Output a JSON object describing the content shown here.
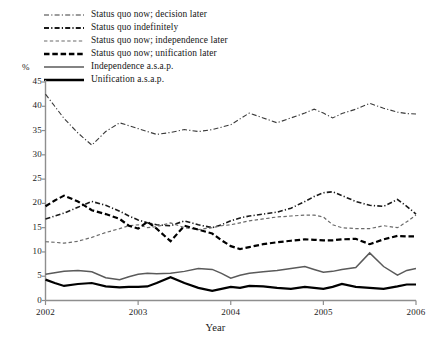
{
  "chart_data": {
    "type": "line",
    "title": "",
    "xlabel": "Year",
    "ylabel": "%",
    "ylim": [
      0,
      45
    ],
    "yticks": [
      0,
      5,
      10,
      15,
      20,
      25,
      30,
      35,
      40,
      45
    ],
    "ytick_labels": [
      "0",
      "5",
      "10",
      "15",
      "20",
      "25",
      "30",
      "35",
      "40",
      "45"
    ],
    "xlim": [
      2002,
      2006
    ],
    "xticks": [
      2002,
      2003,
      2004,
      2005,
      2006
    ],
    "xtick_labels": [
      "2002",
      "2003",
      "2004",
      "2005",
      "2006"
    ],
    "grid": false,
    "legend_position": "top-left",
    "x": [
      2002.0,
      2002.1,
      2002.2,
      2002.35,
      2002.5,
      2002.65,
      2002.8,
      2002.9,
      2003.0,
      2003.1,
      2003.2,
      2003.35,
      2003.5,
      2003.65,
      2003.8,
      2003.9,
      2004.0,
      2004.1,
      2004.2,
      2004.35,
      2004.5,
      2004.65,
      2004.8,
      2004.9,
      2005.0,
      2005.1,
      2005.2,
      2005.35,
      2005.5,
      2005.65,
      2005.8,
      2005.9,
      2006.0
    ],
    "series": [
      {
        "name": "Status quo now; decision later",
        "style": "dash-dot",
        "color": "#3a3a3a",
        "width": 1.1,
        "values": [
          42.5,
          40.0,
          37.5,
          34.5,
          32.0,
          34.8,
          36.6,
          36.0,
          35.4,
          34.8,
          34.2,
          34.6,
          35.2,
          34.8,
          35.2,
          35.7,
          36.2,
          37.4,
          38.6,
          37.6,
          36.6,
          37.6,
          38.6,
          39.4,
          38.6,
          37.6,
          38.5,
          39.4,
          40.6,
          39.6,
          38.8,
          38.5,
          38.4
        ]
      },
      {
        "name": "Status quo indefinitely",
        "style": "dash-dot",
        "color": "#1a1a1a",
        "width": 1.6,
        "values": [
          16.8,
          17.4,
          18.0,
          19.2,
          20.4,
          19.6,
          18.4,
          17.4,
          16.6,
          16.0,
          15.6,
          15.4,
          16.4,
          15.6,
          15.0,
          15.6,
          16.4,
          17.0,
          17.4,
          17.8,
          18.2,
          19.0,
          20.4,
          21.4,
          22.2,
          22.4,
          21.6,
          20.4,
          19.6,
          19.4,
          20.8,
          19.4,
          17.8
        ]
      },
      {
        "name": "Status quo now; independence later",
        "style": "fine-dash",
        "color": "#6a6a6a",
        "width": 1.2,
        "values": [
          12.1,
          12.0,
          11.8,
          12.2,
          13.0,
          14.0,
          14.8,
          15.4,
          15.6,
          15.0,
          15.2,
          16.0,
          15.0,
          14.6,
          15.0,
          15.4,
          15.6,
          16.0,
          16.4,
          16.8,
          17.2,
          17.4,
          17.6,
          17.6,
          17.2,
          15.6,
          15.0,
          14.8,
          14.8,
          15.4,
          15.0,
          16.2,
          17.6
        ]
      },
      {
        "name": "Status quo now; unification later",
        "style": "bold-dash",
        "color": "#000000",
        "width": 2.2,
        "values": [
          19.4,
          20.6,
          21.6,
          20.4,
          18.6,
          17.8,
          16.8,
          15.4,
          14.8,
          16.2,
          14.8,
          12.2,
          15.4,
          14.6,
          13.8,
          12.4,
          11.2,
          10.6,
          11.0,
          11.6,
          12.0,
          12.3,
          12.6,
          12.5,
          12.4,
          12.4,
          12.6,
          12.7,
          11.6,
          12.6,
          13.3,
          13.2,
          13.2
        ]
      },
      {
        "name": "Independence a.s.a.p.",
        "style": "solid",
        "color": "#5a5a5a",
        "width": 1.5,
        "values": [
          5.4,
          5.7,
          6.0,
          6.2,
          5.9,
          4.7,
          4.3,
          4.9,
          5.4,
          5.6,
          5.5,
          5.6,
          6.0,
          6.6,
          6.4,
          5.6,
          4.6,
          5.2,
          5.6,
          5.9,
          6.2,
          6.6,
          7.0,
          6.4,
          5.8,
          6.0,
          6.4,
          6.8,
          9.8,
          7.0,
          5.2,
          6.2,
          6.6
        ]
      },
      {
        "name": "Unification a.s.a.p.",
        "style": "solid",
        "color": "#000000",
        "width": 2.2,
        "values": [
          4.3,
          3.6,
          3.0,
          3.4,
          3.6,
          2.9,
          2.7,
          2.8,
          2.8,
          2.9,
          3.6,
          4.8,
          3.6,
          2.6,
          2.0,
          2.4,
          2.8,
          2.6,
          3.0,
          2.9,
          2.6,
          2.4,
          2.8,
          2.6,
          2.4,
          2.8,
          3.4,
          2.8,
          2.6,
          2.4,
          2.9,
          3.3,
          3.3
        ]
      }
    ]
  },
  "legend": {
    "items": [
      {
        "label": "Status quo now; decision later",
        "style": "dash-dot",
        "color": "#3a3a3a",
        "width": 1.1
      },
      {
        "label": "Status quo indefinitely",
        "style": "dash-dot",
        "color": "#1a1a1a",
        "width": 1.8
      },
      {
        "label": "Status quo now; independence later",
        "style": "fine-dash",
        "color": "#6a6a6a",
        "width": 1.2
      },
      {
        "label": "Status quo now; unification later",
        "style": "bold-dash",
        "color": "#000000",
        "width": 2.4
      },
      {
        "label": "Independence a.s.a.p.",
        "style": "solid",
        "color": "#5a5a5a",
        "width": 1.6
      },
      {
        "label": "Unification a.s.a.p.",
        "style": "solid",
        "color": "#000000",
        "width": 2.4
      }
    ]
  },
  "axes": {
    "y_unit_label": "%",
    "x_title": "Year"
  }
}
